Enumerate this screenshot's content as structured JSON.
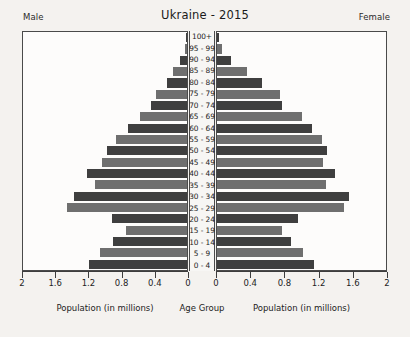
{
  "header": {
    "title": "Ukraine - 2015",
    "male_label": "Male",
    "female_label": "Female"
  },
  "footer": {
    "left_caption": "Population (in millions)",
    "center_caption": "Age Group",
    "right_caption": "Population (in millions)"
  },
  "chart_data": {
    "type": "bar",
    "subtype": "population-pyramid",
    "title": "Ukraine - 2015",
    "xlabel": "Population (in millions)",
    "ylabel": "Age Group",
    "xlim": [
      0,
      2
    ],
    "xticks": [
      2,
      1.6,
      1.2,
      0.8,
      0.4,
      0
    ],
    "xticks_right": [
      0,
      0.4,
      0.8,
      1.2,
      1.6,
      2
    ],
    "grid": false,
    "legend": [
      "Male",
      "Female"
    ],
    "legend_position": "top-corners",
    "categories": [
      "100+",
      "95 - 99",
      "90 - 94",
      "85 - 89",
      "80 - 84",
      "75 - 79",
      "70 - 74",
      "65 - 69",
      "60 - 64",
      "55 - 59",
      "50 - 54",
      "45 - 49",
      "40 - 44",
      "35 - 39",
      "30 - 34",
      "25 - 29",
      "20 - 24",
      "15 - 19",
      "10 - 14",
      "5 - 9",
      "0 - 4"
    ],
    "series": [
      {
        "name": "Male",
        "values": [
          0.01,
          0.03,
          0.08,
          0.17,
          0.25,
          0.38,
          0.44,
          0.57,
          0.72,
          0.86,
          0.97,
          1.04,
          1.22,
          1.12,
          1.38,
          1.46,
          0.92,
          0.75,
          0.9,
          1.06,
          1.2
        ]
      },
      {
        "name": "Female",
        "values": [
          0.02,
          0.06,
          0.17,
          0.35,
          0.53,
          0.74,
          0.77,
          1.0,
          1.13,
          1.24,
          1.3,
          1.25,
          1.4,
          1.29,
          1.56,
          1.5,
          0.96,
          0.77,
          0.87,
          1.02,
          1.15
        ]
      }
    ],
    "colors": {
      "bar_dark": "#3f3f3f",
      "bar_mid": "#6f6f6f",
      "background": "#f4f2ef",
      "plot_background": "#fdfcfb",
      "axis": "#3d3d3d"
    }
  }
}
